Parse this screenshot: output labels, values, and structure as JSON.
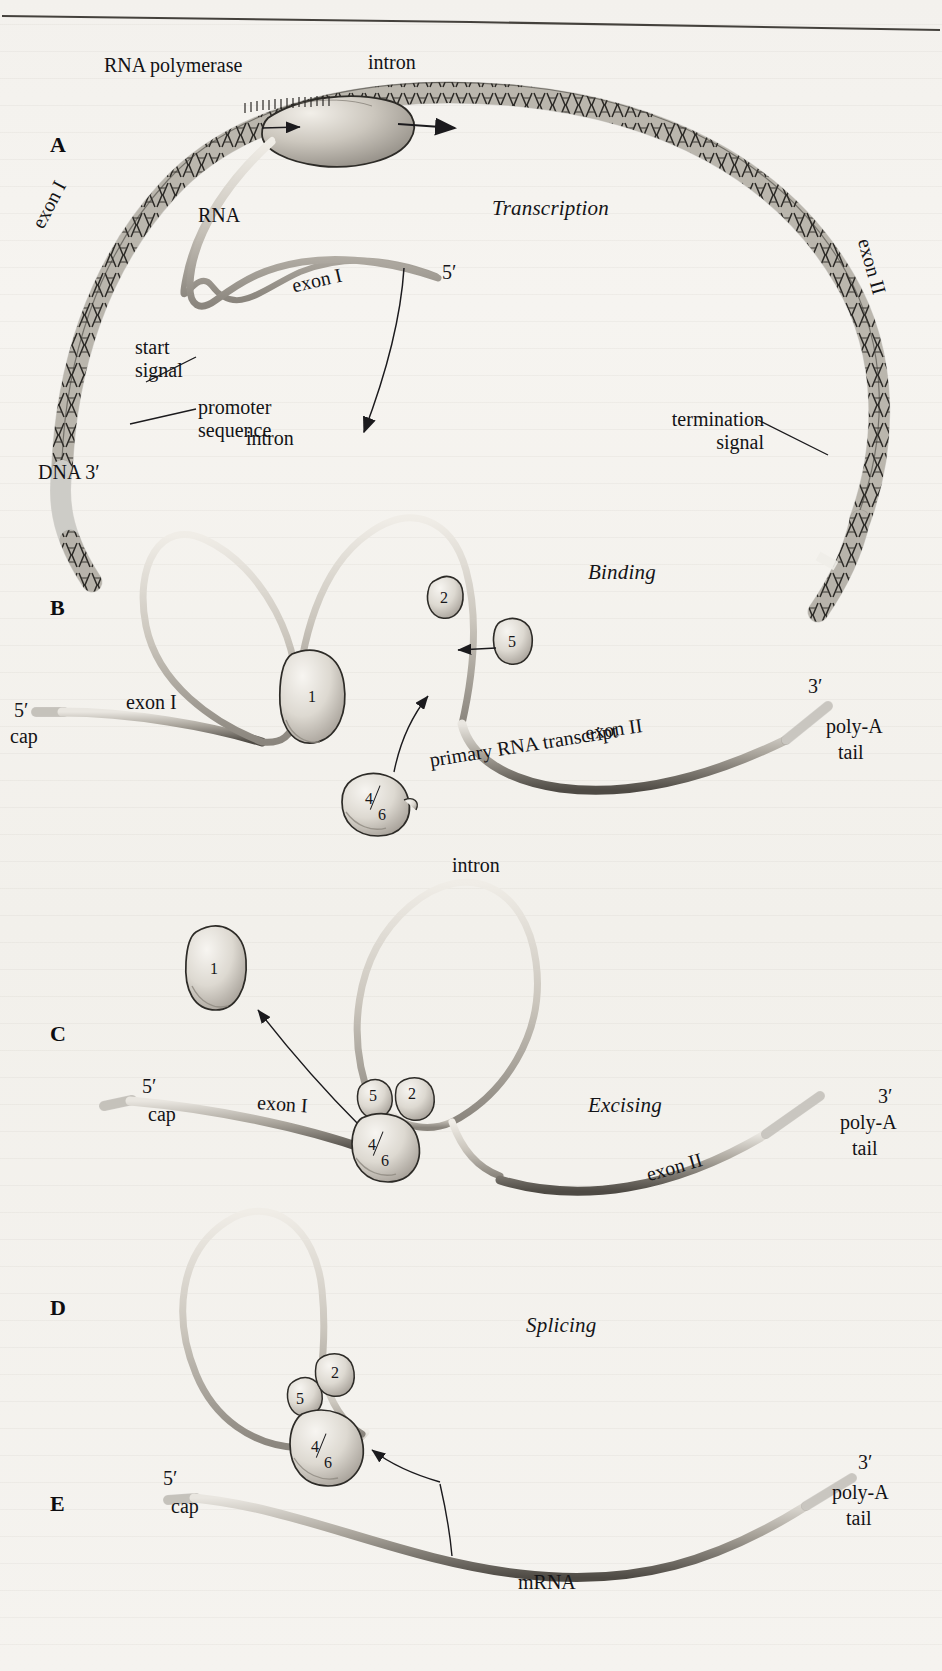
{
  "figure": {
    "type": "biology-diagram",
    "header_rule": true,
    "panels": [
      {
        "letter": "A",
        "stage": "Transcription",
        "labels": [
          "RNA polymerase",
          "intron",
          "exon I",
          "exon II",
          "RNA",
          "start signal",
          "promoter sequence",
          "termination signal",
          "DNA  3'",
          "5'"
        ]
      },
      {
        "letter": "B",
        "stage": "Binding",
        "labels": [
          "intron",
          "5'",
          "cap",
          "exon I",
          "exon II",
          "primary  RNA transcript",
          "poly-A",
          "tail",
          "3'"
        ],
        "particles": [
          "1",
          "2",
          "5",
          "4/6"
        ]
      },
      {
        "letter": "C",
        "stage": "Excising",
        "labels": [
          "intron",
          "5'",
          "cap",
          "exon I",
          "exon II",
          "poly-A",
          "tail",
          "3'"
        ],
        "particles": [
          "1",
          "5",
          "2",
          "4/6"
        ]
      },
      {
        "letter": "D",
        "stage": "Splicing",
        "labels": [],
        "particles": [
          "2",
          "5",
          "4/6"
        ]
      },
      {
        "letter": "E",
        "stage": "",
        "labels": [
          "5'",
          "cap",
          "mRNA",
          "poly-A",
          "tail",
          "3'"
        ],
        "particles": []
      }
    ]
  },
  "a": {
    "panel": "A",
    "rna_polymerase": "RNA polymerase",
    "intron": "intron",
    "stage": "Transcription",
    "exon1": "exon I",
    "exon2": "exon II",
    "rna": "RNA",
    "start_signal_l1": "start",
    "start_signal_l2": "signal",
    "promoter_l1": "promoter",
    "promoter_l2": "sequence",
    "termination_l1": "termination",
    "termination_l2": "signal",
    "dna_end": "DNA  3′",
    "transcript_exon1": "exon I",
    "transcript_5prime": "5′"
  },
  "b": {
    "panel": "B",
    "stage": "Binding",
    "intron": "intron",
    "five_prime": "5′",
    "cap": "cap",
    "exon1": "exon I",
    "exon2": "exon II",
    "transcript": "primary  RNA transcript",
    "polya": "poly-A",
    "tail": "tail",
    "three_prime": "3′",
    "p1": "1",
    "p2": "2",
    "p5": "5",
    "p46_top": "4",
    "p46_bot": "6"
  },
  "c": {
    "panel": "C",
    "stage": "Excising",
    "intron": "intron",
    "five_prime": "5′",
    "cap": "cap",
    "exon1": "exon I",
    "exon2": "exon II",
    "polya": "poly-A",
    "tail": "tail",
    "three_prime": "3′",
    "p1": "1",
    "p5": "5",
    "p2": "2",
    "p46_top": "4",
    "p46_bot": "6"
  },
  "d": {
    "panel": "D",
    "stage": "Splicing",
    "p2": "2",
    "p5": "5",
    "p46_top": "4",
    "p46_bot": "6"
  },
  "e": {
    "panel": "E",
    "five_prime": "5′",
    "cap": "cap",
    "mrna": "mRNA",
    "polya": "poly-A",
    "tail": "tail",
    "three_prime": "3′"
  },
  "colors": {
    "ink": "#17161a",
    "paper": "#f4f2ee",
    "strand_light": "#d9d5cd",
    "strand_dark": "#6f6a62",
    "particle_fill": "#e6e3dc",
    "particle_shade": "#b9b4ab",
    "dna_fill": "#cfcac1"
  }
}
